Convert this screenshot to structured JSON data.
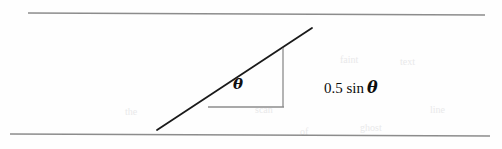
{
  "figure": {
    "name": "inclined-plane-angle-diagram",
    "background_color": "#fefefe",
    "width": 502,
    "height": 149,
    "angle_label": "θ",
    "expression_prefix": "0.5 sin",
    "expression_theta": "θ",
    "expression_full": "0.5 sin θ",
    "stroke_color_dark": "#1a1a1a",
    "stroke_color_light": "#8c8c8c"
  },
  "strokes": {
    "top_rule": {
      "name": "top-border-rule",
      "x1": 28,
      "y1": 13,
      "x2": 485,
      "y2": 15
    },
    "bottom_rule": {
      "name": "bottom-border-rule",
      "x1": 10,
      "y1": 134,
      "x2": 490,
      "y2": 136
    },
    "hypotenuse": {
      "name": "incline-hypotenuse",
      "x1": 157,
      "y1": 130,
      "x2": 312,
      "y2": 28
    },
    "vertical_leg": {
      "name": "triangle-vertical-leg",
      "x1": 283,
      "y1": 48,
      "x2": 283,
      "y2": 107
    },
    "horizontal_leg": {
      "name": "triangle-horizontal-leg",
      "x1": 208,
      "y1": 107,
      "x2": 284,
      "y2": 107
    }
  },
  "artifacts": [
    {
      "text": "the",
      "x": 125,
      "y": 112
    },
    {
      "text": "scan",
      "x": 255,
      "y": 110
    },
    {
      "text": "of",
      "x": 300,
      "y": 132
    },
    {
      "text": "faint",
      "x": 340,
      "y": 60
    },
    {
      "text": "text",
      "x": 400,
      "y": 62
    },
    {
      "text": "ghost",
      "x": 360,
      "y": 128
    },
    {
      "text": "line",
      "x": 430,
      "y": 110
    }
  ]
}
